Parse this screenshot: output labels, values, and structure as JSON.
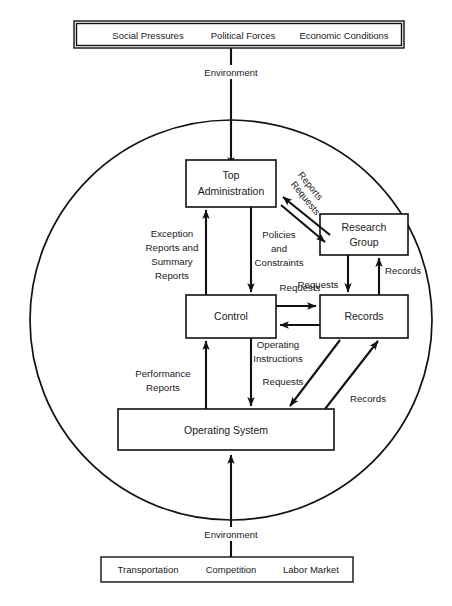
{
  "diagram": {
    "boundary_shape": "circle",
    "top_env_box": {
      "items": [
        "Social Pressures",
        "Political Forces",
        "Economic Conditions"
      ]
    },
    "bottom_env_box": {
      "items": [
        "Transportation",
        "Competition",
        "Labor Market"
      ]
    },
    "env_label_top": "Environment",
    "env_label_bottom": "Environment",
    "nodes": {
      "top_admin_line1": "Top",
      "top_admin_line2": "Administration",
      "research_line1": "Research",
      "research_line2": "Group",
      "control": "Control",
      "records": "Records",
      "operating_system": "Operating System"
    },
    "edge_labels": {
      "reports_diag": "Reports",
      "requests_diag": "Requests",
      "exception_l1": "Exception",
      "exception_l2": "Reports and",
      "exception_l3": "Summary",
      "exception_l4": "Reports",
      "policies_l1": "Policies",
      "policies_l2": "and",
      "policies_l3": "Constraints",
      "requests_rg_records": "Requests",
      "records_rg": "Records",
      "requests_control_records": "Requests",
      "performance_l1": "Performance",
      "performance_l2": "Reports",
      "operating_l1": "Operating",
      "operating_l2": "Instructions",
      "requests_os": "Requests",
      "records_os": "Records"
    },
    "colors": {
      "stroke": "#111111",
      "fill": "#ffffff",
      "text": "#1a1a1a"
    }
  }
}
